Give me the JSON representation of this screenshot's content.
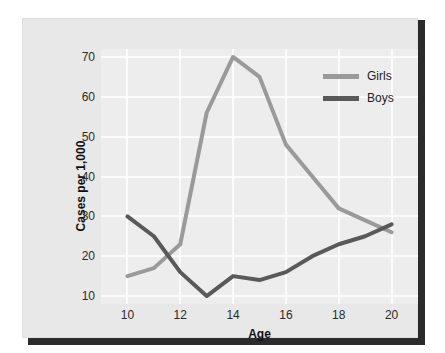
{
  "chart_data": {
    "type": "line",
    "title": "",
    "xlabel": "Age",
    "ylabel": "Cases per 1,000",
    "xlim": [
      9,
      21
    ],
    "ylim": [
      8,
      72
    ],
    "xticks": [
      "10",
      "12",
      "14",
      "16",
      "18",
      "20"
    ],
    "xtick_values": [
      10,
      12,
      14,
      16,
      18,
      20
    ],
    "yticks": [
      "10",
      "20",
      "30",
      "40",
      "50",
      "60",
      "70"
    ],
    "ytick_values": [
      10,
      20,
      30,
      40,
      50,
      60,
      70
    ],
    "grid": true,
    "legend_position": "top-right",
    "x": [
      10,
      11,
      12,
      13,
      14,
      15,
      16,
      17,
      18,
      19,
      20
    ],
    "series": [
      {
        "name": "Girls",
        "color": "#9a9a9a",
        "values": [
          15,
          17,
          23,
          56,
          70,
          65,
          48,
          40,
          32,
          29,
          26
        ]
      },
      {
        "name": "Boys",
        "color": "#595959",
        "values": [
          30,
          25,
          16,
          10,
          15,
          14,
          16,
          20,
          23,
          25,
          28
        ]
      }
    ]
  },
  "legend": {
    "entries": [
      {
        "label": "Girls",
        "color": "#9a9a9a"
      },
      {
        "label": "Boys",
        "color": "#595959"
      }
    ]
  },
  "axes": {
    "x_axis_label": "Age",
    "y_axis_label": "Cases per 1,000"
  },
  "colors": {
    "card_background": "#e8e8e8",
    "plot_background": "#ededed",
    "gridline": "#fbfbfb",
    "shadow": "#2b2b2b",
    "girls_line": "#9a9a9a",
    "boys_line": "#595959",
    "text": "#1d1d1d"
  }
}
